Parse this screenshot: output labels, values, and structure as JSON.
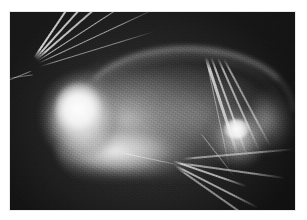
{
  "page": {
    "background_color": "#ffffff",
    "caption": ""
  },
  "figure": {
    "kind": "radiograph",
    "modality": "X-ray",
    "view": "lateral",
    "plate": {
      "background_color": "#0e0e0e",
      "highlight_color": "#ffffff",
      "midtone_color": "#8a8a8a",
      "left": 10,
      "top": 12,
      "width": 285,
      "height": 198
    },
    "anatomy": [
      {
        "name": "skull",
        "label": "skull / head mass",
        "brightness": "very-bright"
      },
      {
        "name": "skull-core",
        "label": "dense cranial core",
        "brightness": "peak-white"
      },
      {
        "name": "mandible",
        "label": "lower jaw / ventral band",
        "brightness": "bright"
      },
      {
        "name": "spine",
        "label": "dorsal vertebral arc",
        "brightness": "mid-bright"
      },
      {
        "name": "torso",
        "label": "thoracic soft tissue",
        "brightness": "mid"
      },
      {
        "name": "dense-mass",
        "label": "rounded dense mass",
        "brightness": "bright"
      },
      {
        "name": "hindquarter",
        "label": "caudal wedge",
        "brightness": "mid"
      }
    ],
    "streaks": [
      {
        "id": 1,
        "x": 24,
        "y": 45,
        "length": 86,
        "angle": -56,
        "thickness": 1.6,
        "opacity": 0.95
      },
      {
        "id": 2,
        "x": 25,
        "y": 46,
        "length": 95,
        "angle": -48,
        "thickness": 1.7,
        "opacity": 0.92
      },
      {
        "id": 3,
        "x": 26,
        "y": 47,
        "length": 104,
        "angle": -41,
        "thickness": 1.5,
        "opacity": 0.88
      },
      {
        "id": 4,
        "x": 27,
        "y": 49,
        "length": 118,
        "angle": -33,
        "thickness": 1.4,
        "opacity": 0.82
      },
      {
        "id": 5,
        "x": 28,
        "y": 51,
        "length": 132,
        "angle": -25,
        "thickness": 1.3,
        "opacity": 0.72
      },
      {
        "id": 6,
        "x": 30,
        "y": 54,
        "length": 120,
        "angle": -17,
        "thickness": 1.2,
        "opacity": 0.6
      },
      {
        "id": 7,
        "x": 22,
        "y": 58,
        "length": 30,
        "angle": 158,
        "thickness": 1.3,
        "opacity": 0.55
      },
      {
        "id": 8,
        "x": 24,
        "y": 62,
        "length": 26,
        "angle": 172,
        "thickness": 1.2,
        "opacity": 0.45
      },
      {
        "id": 9,
        "x": 196,
        "y": 44,
        "length": 104,
        "angle": 72,
        "thickness": 2.6,
        "opacity": 0.85
      },
      {
        "id": 10,
        "x": 201,
        "y": 44,
        "length": 106,
        "angle": 70,
        "thickness": 2.2,
        "opacity": 0.78
      },
      {
        "id": 11,
        "x": 208,
        "y": 45,
        "length": 102,
        "angle": 66,
        "thickness": 1.8,
        "opacity": 0.7
      },
      {
        "id": 12,
        "x": 214,
        "y": 46,
        "length": 100,
        "angle": 62,
        "thickness": 1.5,
        "opacity": 0.6
      },
      {
        "id": 13,
        "x": 163,
        "y": 148,
        "length": 78,
        "angle": 19,
        "thickness": 2.0,
        "opacity": 0.8
      },
      {
        "id": 14,
        "x": 164,
        "y": 152,
        "length": 94,
        "angle": 27,
        "thickness": 1.7,
        "opacity": 0.72
      },
      {
        "id": 15,
        "x": 166,
        "y": 154,
        "length": 102,
        "angle": 35,
        "thickness": 1.5,
        "opacity": 0.62
      },
      {
        "id": 16,
        "x": 168,
        "y": 150,
        "length": 108,
        "angle": 8,
        "thickness": 1.6,
        "opacity": 0.66
      },
      {
        "id": 17,
        "x": 172,
        "y": 146,
        "length": 112,
        "angle": -5,
        "thickness": 1.5,
        "opacity": 0.58
      },
      {
        "id": 18,
        "x": 110,
        "y": 140,
        "length": 64,
        "angle": 12,
        "thickness": 1.4,
        "opacity": 0.5
      },
      {
        "id": 19,
        "x": 196,
        "y": 46,
        "length": 112,
        "angle": 78,
        "thickness": 1.4,
        "opacity": 0.55
      },
      {
        "id": 20,
        "x": 190,
        "y": 120,
        "length": 56,
        "angle": 52,
        "thickness": 1.3,
        "opacity": 0.45
      }
    ]
  }
}
